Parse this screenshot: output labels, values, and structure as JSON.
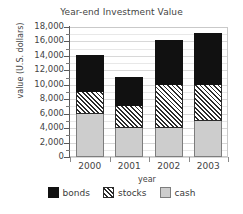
{
  "chart_data": {
    "type": "bar",
    "subtype": "stacked-vertical-bar",
    "title": "Year-end Investment Value",
    "xlabel": "year",
    "ylabel": "value (U.S. dollars)",
    "categories": [
      "2000",
      "2001",
      "2002",
      "2003"
    ],
    "series": [
      {
        "name": "cash",
        "values": [
          6000,
          4000,
          4000,
          5000
        ],
        "color": "#cdcdcd",
        "fill": "solid-light-gray"
      },
      {
        "name": "stocks",
        "values": [
          3000,
          3000,
          6000,
          5000
        ],
        "color": "#ffffff",
        "fill": "diagonal-hatch"
      },
      {
        "name": "bonds",
        "values": [
          5000,
          4000,
          6000,
          7000
        ],
        "color": "#111111",
        "fill": "solid-black"
      }
    ],
    "stack_order_bottom_to_top": [
      "cash",
      "stocks",
      "bonds"
    ],
    "totals": [
      14000,
      11000,
      16000,
      17000
    ],
    "segment_tops": {
      "cash": [
        6000,
        4000,
        4000,
        5000
      ],
      "stocks": [
        9000,
        7000,
        10000,
        10000
      ],
      "bonds": [
        14000,
        11000,
        16000,
        17000
      ]
    },
    "ylim": [
      0,
      18000
    ],
    "ytick_step": 2000,
    "yminor_step": 1000,
    "ytick_labels": [
      "18,000",
      "16,000",
      "14,000",
      "12,000",
      "10,000",
      "8,000",
      "6,000",
      "4,000",
      "2,000",
      "0"
    ],
    "ytick_values": [
      18000,
      16000,
      14000,
      12000,
      10000,
      8000,
      6000,
      4000,
      2000,
      0
    ],
    "grid": true,
    "grid_axis": "y",
    "legend_position": "bottom",
    "legend": [
      {
        "label": "bonds",
        "swatch": "bonds"
      },
      {
        "label": "stocks",
        "swatch": "stocks"
      },
      {
        "label": "cash",
        "swatch": "cash"
      }
    ]
  }
}
